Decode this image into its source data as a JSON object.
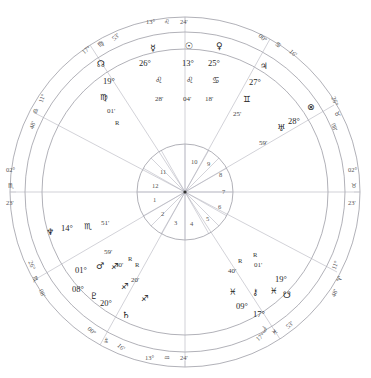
{
  "title": "",
  "chart": {
    "type": "astrological-natal-wheel",
    "angles": {
      "mc": {
        "degree": "13°",
        "sign": "♌",
        "minute": "24'",
        "label": "Midheaven"
      },
      "ic": {
        "degree": "13°",
        "sign": "♒",
        "minute": "24'",
        "label": "Imum Coeli"
      },
      "asc": {
        "degree": "02°",
        "sign": "♏",
        "minute": "23'",
        "label": "Ascendant"
      },
      "dsc": {
        "degree": "02°",
        "sign": "♉",
        "minute": "23'",
        "label": "Descendant"
      }
    },
    "house_cusps": [
      {
        "house": 1,
        "degree": "02°",
        "sign": "♏",
        "minute": "23'"
      },
      {
        "house": 2,
        "degree": "26°",
        "sign": "♏",
        "minute": "08'"
      },
      {
        "house": 3,
        "degree": "00°",
        "sign": "♑",
        "minute": "16'"
      },
      {
        "house": 4,
        "degree": "13°",
        "sign": "♒",
        "minute": "24'"
      },
      {
        "house": 5,
        "degree": "17°",
        "sign": "♓",
        "minute": "53'"
      },
      {
        "house": 6,
        "degree": "11°",
        "sign": "♈",
        "minute": "48'"
      },
      {
        "house": 7,
        "degree": "02°",
        "sign": "♉",
        "minute": "23'"
      },
      {
        "house": 8,
        "degree": "26°",
        "sign": "♉",
        "minute": "08'"
      },
      {
        "house": 9,
        "degree": "00°",
        "sign": "♋",
        "minute": "16'"
      },
      {
        "house": 10,
        "degree": "13°",
        "sign": "♌",
        "minute": "24'"
      },
      {
        "house": 11,
        "degree": "17°",
        "sign": "♍",
        "minute": "53'"
      },
      {
        "house": 12,
        "degree": "11°",
        "sign": "♎",
        "minute": "48'"
      }
    ],
    "house_numbers": [
      "1",
      "2",
      "3",
      "4",
      "5",
      "6",
      "7",
      "8",
      "9",
      "10",
      "11",
      "12"
    ],
    "planets": [
      {
        "name": "mercury",
        "glyph": "☿",
        "degree": "26°",
        "sign": "♌",
        "minute": "28'",
        "retrograde": false
      },
      {
        "name": "sun",
        "glyph": "☉",
        "degree": "13°",
        "sign": "♌",
        "minute": "04'",
        "retrograde": false
      },
      {
        "name": "venus",
        "glyph": "♀",
        "degree": "25°",
        "sign": "♋",
        "minute": "18'",
        "retrograde": false
      },
      {
        "name": "jupiter",
        "glyph": "♃",
        "degree": "27°",
        "sign": "♊",
        "minute": "25'",
        "retrograde": false
      },
      {
        "name": "uranus",
        "glyph": "♅",
        "degree": "28°",
        "sign": "♉",
        "minute": "59'",
        "retrograde": false
      },
      {
        "name": "fortune",
        "glyph": "⊗",
        "degree": "28°",
        "sign": "♉",
        "minute": "",
        "retrograde": false
      },
      {
        "name": "north-node",
        "glyph": "☊",
        "degree": "19°",
        "sign": "♍",
        "minute": "01'",
        "retrograde": true
      },
      {
        "name": "neptune",
        "glyph": "♆",
        "degree": "14°",
        "sign": "♏",
        "minute": "51'",
        "retrograde": false
      },
      {
        "name": "mars",
        "glyph": "♂",
        "degree": "01°",
        "sign": "♐",
        "minute": "59'",
        "retrograde": true
      },
      {
        "name": "pluto",
        "glyph": "♇",
        "degree": "08°",
        "sign": "♐",
        "minute": "30'",
        "retrograde": true
      },
      {
        "name": "saturn",
        "glyph": "♄",
        "degree": "20°",
        "sign": "♐",
        "minute": "20'",
        "retrograde": true
      },
      {
        "name": "chiron",
        "glyph": "⚷",
        "degree": "09°",
        "sign": "♓",
        "minute": "40'",
        "retrograde": true
      },
      {
        "name": "moon",
        "glyph": "☽",
        "degree": "17°",
        "sign": "♓",
        "minute": "53'",
        "retrograde": false
      },
      {
        "name": "south-node",
        "glyph": "☋",
        "degree": "19°",
        "sign": "♓",
        "minute": "01'",
        "retrograde": true
      }
    ],
    "colors": {
      "wheel_stroke": "#8f8f9a",
      "spoke_stroke": "#b3b3bd",
      "aspect_stroke": "#a8a8b4",
      "text": "#2b2b2b",
      "background": "#ffffff"
    }
  }
}
